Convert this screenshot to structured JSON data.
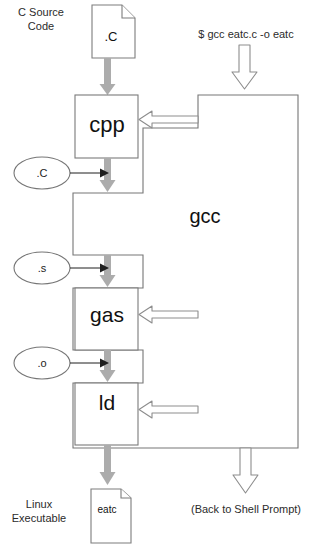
{
  "diagram": {
    "colors": {
      "outline": "#6b6b6b",
      "box_outline": "#7a7a7a",
      "gray_arrow": "#a8a8a8",
      "thin_arrow": "#222222",
      "hollow_arrow": "#8a8a8a",
      "text": "#1a1a1a",
      "background": "#ffffff"
    },
    "labels": {
      "c_source_code": "C Source\nCode",
      "command": "$ gcc eatc.c -o eatc",
      "linux_executable": "Linux\nExecutable",
      "back_to_shell": "(Back to Shell Prompt)"
    },
    "stages": [
      {
        "id": "cpp",
        "label": "cpp"
      },
      {
        "id": "gas",
        "label": "gas"
      },
      {
        "id": "ld",
        "label": "ld"
      }
    ],
    "wrapper": {
      "id": "gcc",
      "label": "gcc"
    },
    "intermediate_files": [
      {
        "id": "dot-c",
        "label": ".C"
      },
      {
        "id": "dot-s",
        "label": ".s"
      },
      {
        "id": "dot-o",
        "label": ".o"
      }
    ],
    "documents": [
      {
        "id": "source-doc",
        "label": ".C"
      },
      {
        "id": "executable-doc",
        "label": "eatc"
      }
    ]
  }
}
